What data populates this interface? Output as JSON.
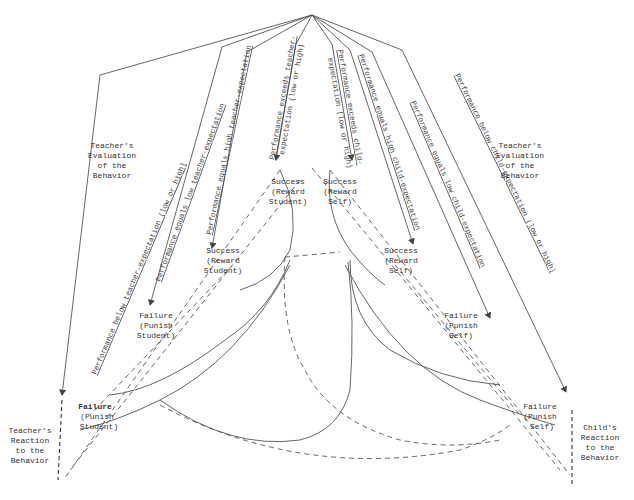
{
  "diagram": {
    "apex": {
      "x": 312,
      "y": 15
    },
    "evaluation_labels": {
      "left": [
        "Teacher's",
        "Evaluation",
        "of the",
        "Behavior"
      ],
      "right": [
        "Teacher's",
        "Evaluation",
        "of the",
        "Behavior"
      ]
    },
    "reaction_labels": {
      "left": [
        "Teacher's",
        "Reaction",
        "to the",
        "Behavior"
      ],
      "right": [
        "Child's",
        "Reaction",
        "to the",
        "Behavior"
      ]
    },
    "line_labels": {
      "t_below": "Performance below teacher-expectation (low or high)",
      "t_equals_low": "Performance equals low teacher-expectation",
      "t_equals_high": "Performance equals high teacher-expectation",
      "t_exceeds_1": "Performance exceeds teacher-",
      "t_exceeds_2": "expectation (low or high)",
      "c_exceeds_1": "Performance exceeds child-",
      "c_exceeds_2": "expectation (low or high)",
      "c_equals_high": "Performance equals high child-expectation",
      "c_equals_low": "Performance equals low child-expectation",
      "c_below": "Performance below child-expectation (low or high)"
    },
    "outcome_labels": {
      "success_reward_student_top": [
        "Success",
        "(Reward",
        "Student)"
      ],
      "success_reward_self_top": [
        "Success",
        "(Reward",
        "Self)"
      ],
      "success_reward_student_mid": [
        "Success",
        "(Reward",
        "Student)"
      ],
      "success_reward_self_mid": [
        "Success",
        "(Reward",
        "Self)"
      ],
      "failure_punish_student_mid": [
        "Failure",
        "(Punish",
        "Student)"
      ],
      "failure_punish_self_mid": [
        "Failure",
        "(Punish",
        "Self)"
      ],
      "failure_punish_student_low": [
        "Failure",
        "(Punish",
        "Student)"
      ],
      "failure_punish_self_low": [
        "Failure",
        "(Punish",
        "Self)"
      ]
    }
  }
}
